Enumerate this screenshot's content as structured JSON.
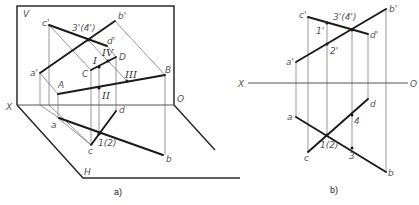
{
  "figure_a": {
    "caption": "a)",
    "plane_labels": {
      "v": "V",
      "h": "H",
      "x": "X",
      "o": "O"
    },
    "points": {
      "c_prime": "c'",
      "b_prime": "b'",
      "p34_prime": "3'(4')",
      "d_prime": "d'",
      "a_prime": "a'",
      "C": "C",
      "D": "D",
      "B": "B",
      "A": "A",
      "I": "I",
      "II": "II",
      "III": "III",
      "IV": "IV",
      "a": "a",
      "d": "d",
      "c": "c",
      "p12": "1(2)",
      "b": "b"
    }
  },
  "figure_b": {
    "caption": "b)",
    "axis_labels": {
      "x": "X",
      "o": "O"
    },
    "points": {
      "c_prime": "c'",
      "b_prime": "b'",
      "p34_prime": "3'(4')",
      "d_prime": "d'",
      "p1_prime": "1'",
      "p2_prime": "2'",
      "a_prime": "a'",
      "a": "a",
      "d": "d",
      "c": "c",
      "p12": "1(2)",
      "p4": "4",
      "p3": "3",
      "b": "b"
    }
  }
}
